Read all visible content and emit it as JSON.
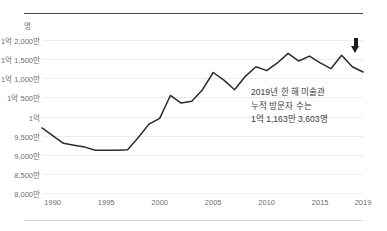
{
  "chart_data": {
    "type": "line",
    "title": "",
    "xlabel": "",
    "ylabel": "",
    "unit_label": "명",
    "x": [
      1989,
      1990,
      1991,
      1992,
      1993,
      1994,
      1995,
      1996,
      1997,
      1998,
      1999,
      2000,
      2001,
      2002,
      2003,
      2004,
      2005,
      2006,
      2007,
      2008,
      2009,
      2010,
      2011,
      2012,
      2013,
      2014,
      2015,
      2016,
      2017,
      2018,
      2019
    ],
    "values": [
      97000000,
      95000000,
      93000000,
      92500000,
      92000000,
      91200000,
      91200000,
      91200000,
      91300000,
      94500000,
      98000000,
      99500000,
      105500000,
      103500000,
      104000000,
      107000000,
      111500000,
      109500000,
      107000000,
      110500000,
      113000000,
      112000000,
      114000000,
      116500000,
      114500000,
      115800000,
      114000000,
      112500000,
      116000000,
      113000000,
      111633603
    ],
    "xticks": [
      1990,
      1995,
      2000,
      2005,
      2010,
      2015,
      2019
    ],
    "xtick_labels": [
      "1990",
      "1995",
      "2000",
      "2005",
      "2010",
      "2015",
      "2019"
    ],
    "yticks": [
      80000000,
      85000000,
      90000000,
      95000000,
      100000000,
      105000000,
      110000000,
      115000000,
      120000000
    ],
    "ytick_labels": [
      "8,000만",
      "8,500만",
      "9,000만",
      "9,500만",
      "1억",
      "1억 500만",
      "1억 1,000만",
      "1억 1,500만",
      "1억 2,000만"
    ],
    "ylim": [
      80000000,
      120000000
    ],
    "xlim": [
      1989,
      2019
    ],
    "grid": true,
    "legend": null,
    "line_color": "#2b2b2b",
    "grid_color": "#ececec"
  },
  "annotation": {
    "line1": "2019년 한 해 미술관",
    "line2": "누적 방문자 수는",
    "line3": "1억 1,163만 3,603명"
  },
  "marker": {
    "name": "down-arrow-marker",
    "color": "#1d1d1d"
  }
}
